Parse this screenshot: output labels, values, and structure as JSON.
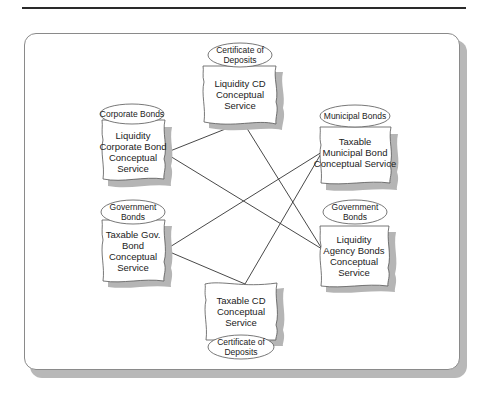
{
  "diagram": {
    "type": "service-interconnection",
    "nodes": [
      {
        "id": "liquidity_cd",
        "tag_lines": [
          "Certificate of",
          "Deposits"
        ],
        "label_lines": [
          "Liquidity CD",
          "Conceptual",
          "Service"
        ]
      },
      {
        "id": "liquidity_corporate",
        "tag_lines": [
          "Corporate Bonds"
        ],
        "label_lines": [
          "Liquidity",
          "Corporate Bond",
          "Conceptual",
          "Service"
        ]
      },
      {
        "id": "taxable_municipal",
        "tag_lines": [
          "Municipal Bonds"
        ],
        "label_lines": [
          "Taxable",
          "Municipal Bond",
          "Conceptual Service"
        ]
      },
      {
        "id": "taxable_gov",
        "tag_lines": [
          "Government",
          "Bonds"
        ],
        "label_lines": [
          "Taxable Gov.",
          "Bond",
          "Conceptual",
          "Service"
        ]
      },
      {
        "id": "liquidity_agency",
        "tag_lines": [
          "Government",
          "Bonds"
        ],
        "label_lines": [
          "Liquidity",
          "Agency Bonds",
          "Conceptual",
          "Service"
        ]
      },
      {
        "id": "taxable_cd",
        "tag_lines": [
          "Certificate of",
          "Deposits"
        ],
        "label_lines": [
          "Taxable CD",
          "Conceptual",
          "Service"
        ]
      }
    ],
    "edges": [
      {
        "from": "liquidity_cd",
        "to": "liquidity_corporate"
      },
      {
        "from": "liquidity_cd",
        "to": "liquidity_agency"
      },
      {
        "from": "liquidity_corporate",
        "to": "liquidity_agency"
      },
      {
        "from": "taxable_gov",
        "to": "taxable_municipal"
      },
      {
        "from": "taxable_gov",
        "to": "taxable_cd"
      },
      {
        "from": "taxable_cd",
        "to": "taxable_municipal"
      }
    ]
  },
  "text": {
    "cd_top_tag_1": "Certificate of",
    "cd_top_tag_2": "Deposits",
    "cd_top_l1": "Liquidity CD",
    "cd_top_l2": "Conceptual",
    "cd_top_l3": "Service",
    "corp_tag": "Corporate Bonds",
    "corp_l1": "Liquidity",
    "corp_l2": "Corporate Bond",
    "corp_l3": "Conceptual",
    "corp_l4": "Service",
    "muni_tag": "Municipal Bonds",
    "muni_l1": "Taxable",
    "muni_l2": "Municipal Bond",
    "muni_l3": "Conceptual Service",
    "gov_tag_1": "Government",
    "gov_tag_2": "Bonds",
    "gov_l1": "Taxable Gov.",
    "gov_l2": "Bond",
    "gov_l3": "Conceptual",
    "gov_l4": "Service",
    "agency_tag_1": "Government",
    "agency_tag_2": "Bonds",
    "agency_l1": "Liquidity",
    "agency_l2": "Agency Bonds",
    "agency_l3": "Conceptual",
    "agency_l4": "Service",
    "cd_bot_l1": "Taxable CD",
    "cd_bot_l2": "Conceptual",
    "cd_bot_l3": "Service",
    "cd_bot_tag_1": "Certificate of",
    "cd_bot_tag_2": "Deposits"
  },
  "colors": {
    "line": "#333333",
    "shadow": "#b5b5b5",
    "node_fill": "#ffffff",
    "node_stroke": "#555555"
  }
}
